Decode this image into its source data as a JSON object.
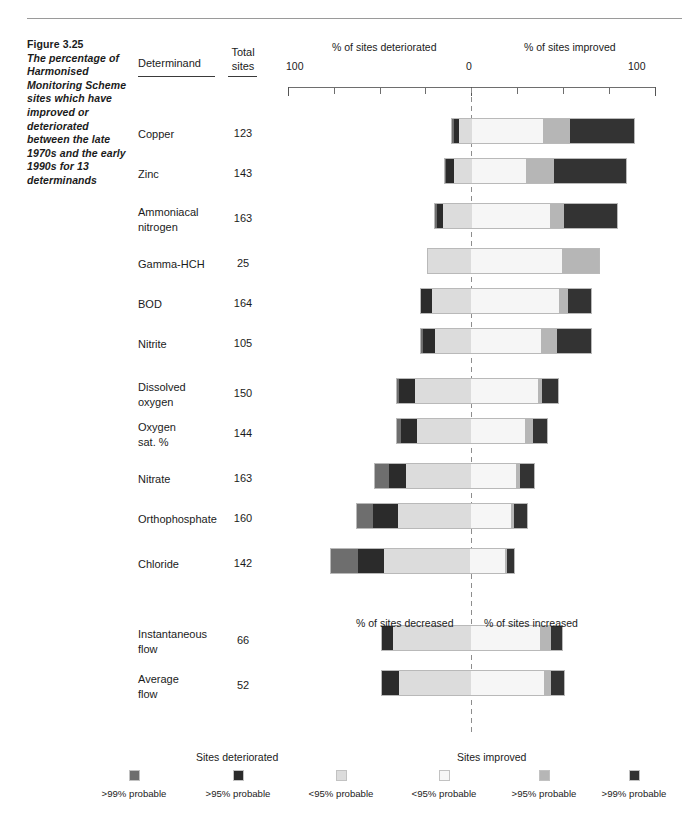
{
  "caption": {
    "figure_number": "Figure 3.25",
    "description": "The percentage of Harmonised Monitoring Scheme sites which have improved or deteriorated between the late 1970s and the early 1990s for 13 determinands"
  },
  "columns": {
    "determinand": "Determinand",
    "total_line1": "Total",
    "total_line2": "sites"
  },
  "axis": {
    "left_title": "% of sites deteriorated",
    "right_title": "% of sites improved",
    "left_label": "100",
    "center_label": "0",
    "right_label": "100",
    "min": 100,
    "max": 100,
    "tick_step": 25
  },
  "flow_axis": {
    "left_title": "% of sites decreased",
    "right_title": "% of sites increased"
  },
  "legend": {
    "deteriorated_heading": "Sites deteriorated",
    "improved_heading": "Sites improved",
    "items": [
      {
        "label": ">99% probable",
        "color": "#6e6e6e",
        "key": "det_99"
      },
      {
        "label": ">95% probable",
        "color": "#2b2b2b",
        "key": "det_95"
      },
      {
        "label": "<95% probable",
        "color": "#dcdcdc",
        "key": "det_lt95"
      },
      {
        "label": "<95% probable",
        "color": "#f6f6f6",
        "key": "imp_lt95"
      },
      {
        "label": ">95% probable",
        "color": "#b6b6b6",
        "key": "imp_95"
      },
      {
        "label": ">99% probable",
        "color": "#333333",
        "key": "imp_99"
      }
    ]
  },
  "chart_data": {
    "type": "bar",
    "subtype": "diverging-stacked-bar",
    "title": "The percentage of Harmonised Monitoring Scheme sites which have improved or deteriorated between the late 1970s and the early 1990s for 13 determinands",
    "xlabel": "% of sites deteriorated  /  % of sites improved",
    "ylabel": "Determinand",
    "xlim": [
      -100,
      100
    ],
    "grid": false,
    "legend_position": "bottom",
    "series": [
      {
        "name": ">99% probable deteriorated",
        "color": "#6e6e6e"
      },
      {
        "name": ">95% probable deteriorated",
        "color": "#2b2b2b"
      },
      {
        "name": "<95% probable deteriorated",
        "color": "#dcdcdc"
      },
      {
        "name": "<95% probable improved",
        "color": "#f6f6f6"
      },
      {
        "name": ">95% probable improved",
        "color": "#b6b6b6"
      },
      {
        "name": ">99% probable improved",
        "color": "#333333"
      }
    ],
    "categories": [
      "Copper",
      "Zinc",
      "Ammoniacal nitrogen",
      "Gamma-HCH",
      "BOD",
      "Nitrite",
      "Dissolved oxygen",
      "Oxygen sat. %",
      "Nitrate",
      "Orthophosphate",
      "Chloride",
      "Instantaneous flow",
      "Average flow"
    ],
    "rows": [
      {
        "name": "Copper",
        "name_lines": [
          "Copper"
        ],
        "total_sites": "123",
        "det_99": 1,
        "det_95": 3,
        "det_lt95": 7,
        "imp_lt95": 39,
        "imp_95": 15,
        "imp_99": 35
      },
      {
        "name": "Zinc",
        "name_lines": [
          "Zinc"
        ],
        "total_sites": "143",
        "det_99": 1,
        "det_95": 4,
        "det_lt95": 10,
        "imp_lt95": 30,
        "imp_95": 15,
        "imp_99": 40
      },
      {
        "name": "Ammoniacal nitrogen",
        "name_lines": [
          "Ammoniacal",
          "nitrogen"
        ],
        "total_sites": "163",
        "det_99": 1,
        "det_95": 3,
        "det_lt95": 16,
        "imp_lt95": 43,
        "imp_95": 8,
        "imp_99": 29
      },
      {
        "name": "Gamma-HCH",
        "name_lines": [
          "Gamma-HCH"
        ],
        "total_sites": "25",
        "det_99": 0,
        "det_95": 0,
        "det_lt95": 24,
        "imp_lt95": 50,
        "imp_95": 20,
        "imp_99": 0
      },
      {
        "name": "BOD",
        "name_lines": [
          "BOD"
        ],
        "total_sites": "164",
        "det_99": 0,
        "det_95": 6,
        "det_lt95": 22,
        "imp_lt95": 48,
        "imp_95": 5,
        "imp_99": 13
      },
      {
        "name": "Nitrite",
        "name_lines": [
          "Nitrite"
        ],
        "total_sites": "105",
        "det_99": 1,
        "det_95": 7,
        "det_lt95": 20,
        "imp_lt95": 38,
        "imp_95": 9,
        "imp_99": 19
      },
      {
        "name": "Dissolved oxygen",
        "name_lines": [
          "Dissolved",
          "oxygen"
        ],
        "total_sites": "150",
        "det_99": 1,
        "det_95": 9,
        "det_lt95": 31,
        "imp_lt95": 37,
        "imp_95": 2,
        "imp_99": 9
      },
      {
        "name": "Oxygen sat. %",
        "name_lines": [
          "Oxygen",
          "sat. %"
        ],
        "total_sites": "144",
        "det_99": 2,
        "det_95": 9,
        "det_lt95": 30,
        "imp_lt95": 30,
        "imp_95": 4,
        "imp_99": 8
      },
      {
        "name": "Nitrate",
        "name_lines": [
          "Nitrate"
        ],
        "total_sites": "163",
        "det_99": 8,
        "det_95": 9,
        "det_lt95": 36,
        "imp_lt95": 25,
        "imp_95": 2,
        "imp_99": 8
      },
      {
        "name": "Orthophosphate",
        "name_lines": [
          "Orthophosphate"
        ],
        "total_sites": "160",
        "det_99": 9,
        "det_95": 14,
        "det_lt95": 40,
        "imp_lt95": 22,
        "imp_95": 2,
        "imp_99": 7
      },
      {
        "name": "Chloride",
        "name_lines": [
          "Chloride"
        ],
        "total_sites": "142",
        "det_99": 15,
        "det_95": 14,
        "det_lt95": 48,
        "imp_lt95": 19,
        "imp_95": 1,
        "imp_99": 4
      },
      {
        "name": "Instantaneous flow",
        "name_lines": [
          "Instantaneous",
          "flow"
        ],
        "total_sites": "66",
        "det_99": 0,
        "det_95": 6,
        "det_lt95": 43,
        "imp_lt95": 38,
        "imp_95": 6,
        "imp_99": 6
      },
      {
        "name": "Average flow",
        "name_lines": [
          "Average",
          "flow"
        ],
        "total_sites": "52",
        "det_99": 0,
        "det_95": 9,
        "det_lt95": 40,
        "imp_lt95": 40,
        "imp_95": 4,
        "imp_99": 7
      }
    ]
  },
  "layout": {
    "axis_left_px": 288,
    "axis_zero_px": 471,
    "axis_right_px": 655,
    "row_tops": [
      118,
      158,
      203,
      248,
      288,
      328,
      378,
      418,
      463,
      503,
      548,
      625,
      670
    ]
  }
}
